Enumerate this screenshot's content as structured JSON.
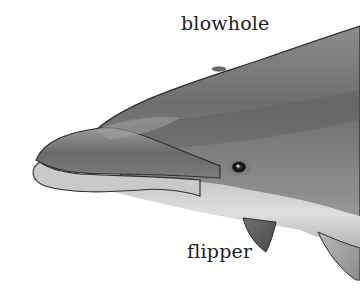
{
  "illustration": {
    "subject": "dolphin head",
    "labels": {
      "blowhole": "blowhole",
      "flipper": "flipper"
    },
    "colors": {
      "background": "#ffffff",
      "body_dark": "#5a5a5a",
      "body_mid": "#8a8a8a",
      "belly_light": "#d8d8d8",
      "outline": "#2e2e2e",
      "label_text": "#1e1e1e"
    }
  }
}
